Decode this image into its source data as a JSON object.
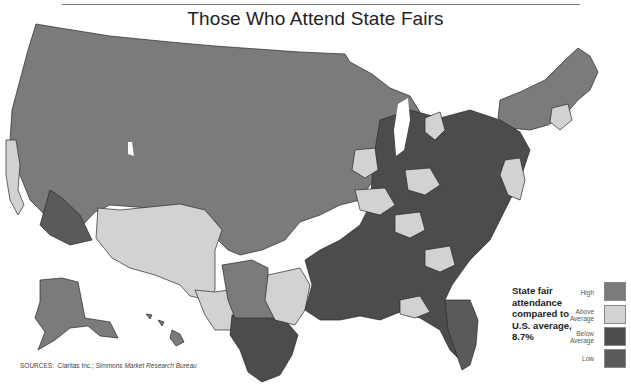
{
  "title": "Those Who Attend State Fairs",
  "annotation": {
    "line1": "State fair",
    "line2": "attendance",
    "line3": "compared to",
    "line4": "U.S. average,",
    "line5": "8.7%"
  },
  "legend": {
    "items": [
      {
        "label_line1": "High",
        "label_line2": "",
        "color": "#7b7b7b"
      },
      {
        "label_line1": "Above",
        "label_line2": "Average",
        "color": "#d2d2d2"
      },
      {
        "label_line1": "Below",
        "label_line2": "Average",
        "color": "#4c4c4c"
      },
      {
        "label_line1": "Low",
        "label_line2": "",
        "color": "#5a5a5a"
      }
    ]
  },
  "sources": {
    "prefix": "SOURCES:",
    "text1": "Claritas Inc.;",
    "text2": "Simmons Market Research Bureau"
  },
  "colors": {
    "high": "#7b7b7b",
    "above_average": "#d2d2d2",
    "below_average": "#4c4c4c",
    "low": "#5a5a5a",
    "border": "#2a2a2a"
  }
}
